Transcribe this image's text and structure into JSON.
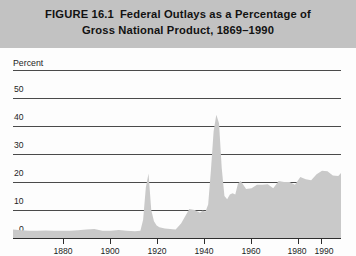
{
  "figure": {
    "number_label": "FIGURE 16.1",
    "title_line_1": "Federal Outlays as a Percentage of",
    "title_line_2": "Gross National Product, 1869–1990",
    "band_color": "#c2c2c2"
  },
  "axes": {
    "y_axis_caption": "Percent",
    "y_ticks": [
      "50",
      "40",
      "30",
      "20",
      "10",
      "0"
    ],
    "x_ticks": [
      "1880",
      "1900",
      "1920",
      "1940",
      "1960",
      "1980",
      "1990"
    ]
  },
  "chart_data": {
    "type": "area",
    "xlabel": "",
    "ylabel": "Percent",
    "xlim": [
      1869,
      1990
    ],
    "ylim": [
      0,
      55
    ],
    "grid": true,
    "legend": "none",
    "fill_color": "#c9c9c9",
    "series_name": "Federal outlays as a percentage of GNP",
    "x_tick_values": [
      1880,
      1900,
      1920,
      1940,
      1960,
      1980,
      1990
    ],
    "y_tick_values": [
      0,
      10,
      20,
      30,
      40,
      50
    ],
    "x": [
      1869,
      1872,
      1875,
      1878,
      1881,
      1884,
      1887,
      1890,
      1893,
      1896,
      1899,
      1902,
      1905,
      1908,
      1911,
      1914,
      1916,
      1917,
      1918,
      1919,
      1920,
      1921,
      1922,
      1923,
      1925,
      1927,
      1929,
      1931,
      1933,
      1934,
      1936,
      1938,
      1939,
      1940,
      1941,
      1942,
      1943,
      1944,
      1945,
      1946,
      1947,
      1948,
      1949,
      1950,
      1951,
      1952,
      1953,
      1955,
      1957,
      1959,
      1961,
      1963,
      1965,
      1967,
      1969,
      1971,
      1973,
      1975,
      1977,
      1979,
      1981,
      1983,
      1985,
      1987,
      1989,
      1990
    ],
    "values": [
      3.0,
      2.8,
      2.6,
      2.6,
      2.7,
      2.6,
      2.6,
      2.6,
      2.8,
      3.0,
      3.2,
      2.6,
      2.6,
      2.9,
      2.6,
      2.4,
      2.6,
      6.5,
      18.0,
      23.0,
      10.0,
      6.0,
      4.5,
      3.8,
      3.4,
      3.2,
      3.0,
      5.2,
      8.6,
      10.4,
      10.0,
      9.0,
      9.8,
      9.4,
      12.0,
      24.0,
      38.0,
      44.0,
      41.0,
      25.0,
      15.0,
      13.8,
      15.5,
      16.0,
      15.5,
      19.5,
      20.4,
      17.5,
      17.8,
      19.0,
      19.0,
      19.2,
      17.8,
      20.4,
      20.0,
      20.0,
      19.0,
      21.8,
      21.0,
      20.6,
      22.8,
      24.0,
      23.8,
      22.3,
      22.1,
      23.2
    ],
    "annotations": [
      {
        "label": "World War I peak",
        "x": 1919,
        "y": 23.0
      },
      {
        "label": "World War II peak",
        "x": 1944,
        "y": 44.0
      }
    ]
  }
}
